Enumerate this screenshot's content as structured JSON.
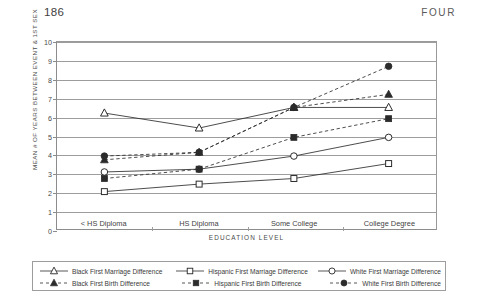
{
  "page": {
    "folio": "186",
    "running_head": "FOUR"
  },
  "chart_data": {
    "type": "line",
    "title": "",
    "xlabel": "EDUCATION LEVEL",
    "ylabel": "MEAN # OF YEARS BETWEEN EVENT & 1ST SEX",
    "categories": [
      "< HS Diploma",
      "HS Diploma",
      "Some College",
      "College Degree"
    ],
    "ylim": [
      0,
      10
    ],
    "yticks": [
      "0",
      "1",
      "2",
      "3",
      "4",
      "5",
      "6",
      "7",
      "8",
      "9",
      "10"
    ],
    "grid": true,
    "legend_position": "bottom",
    "series": [
      {
        "name": "Black First Marriage Difference",
        "marker": "triangle-open",
        "line": "solid",
        "values": [
          6.2,
          5.4,
          6.5,
          6.5
        ]
      },
      {
        "name": "Hispanic First Marriage Difference",
        "marker": "square-open",
        "line": "solid",
        "values": [
          2.0,
          2.4,
          2.7,
          3.5
        ]
      },
      {
        "name": "White First Marriage Difference",
        "marker": "circle-open",
        "line": "solid",
        "values": [
          3.05,
          3.2,
          3.9,
          4.9
        ]
      },
      {
        "name": "Black First Birth Difference",
        "marker": "triangle-filled",
        "line": "dashed",
        "values": [
          3.7,
          4.1,
          6.5,
          7.2
        ]
      },
      {
        "name": "Hispanic First Birth Difference",
        "marker": "square-filled",
        "line": "dashed",
        "values": [
          2.7,
          3.2,
          4.9,
          5.9
        ]
      },
      {
        "name": "White First Birth Difference",
        "marker": "circle-filled",
        "line": "dashed",
        "values": [
          3.9,
          4.1,
          6.5,
          8.7
        ]
      }
    ],
    "colors": {
      "ink": "#2b2b2b",
      "grid": "#9d9d9d",
      "axis": "#8c8c8c",
      "text": "#3f3f3f"
    }
  },
  "legend": {
    "row1": [
      "Black First Marriage Difference",
      "Hispanic First Marriage Difference",
      "White First Marriage Difference"
    ],
    "row2": [
      "Black First Birth Difference",
      "Hispanic First Birth Difference",
      "White First Birth Difference"
    ]
  }
}
